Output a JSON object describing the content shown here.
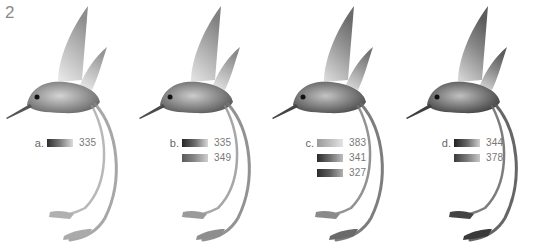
{
  "figure": {
    "number": "2"
  },
  "panels": [
    {
      "label": "a.",
      "swatches": [
        {
          "value": "335",
          "gradient": [
            "#2e2e2e",
            "#7a7a7a",
            "#dcdcdc"
          ]
        }
      ]
    },
    {
      "label": "b.",
      "swatches": [
        {
          "value": "335",
          "gradient": [
            "#262626",
            "#6c6c6c",
            "#d8d8d8"
          ]
        },
        {
          "value": "349",
          "gradient": [
            "#5a5a5a",
            "#8a8a8a",
            "#cfcfcf"
          ]
        }
      ]
    },
    {
      "label": "c.",
      "swatches": [
        {
          "value": "383",
          "gradient": [
            "#9a9a9a",
            "#bdbdbd",
            "#e3e3e3"
          ]
        },
        {
          "value": "341",
          "gradient": [
            "#2a2a2a",
            "#6e6e6e",
            "#bdbdbd"
          ]
        },
        {
          "value": "327",
          "gradient": [
            "#2c2c2c",
            "#5e5e5e",
            "#b0b0b0"
          ]
        }
      ]
    },
    {
      "label": "d.",
      "swatches": [
        {
          "value": "344",
          "gradient": [
            "#222222",
            "#666666",
            "#d0d0d0"
          ]
        },
        {
          "value": "378",
          "gradient": [
            "#3a3a3a",
            "#7a7a7a",
            "#c8c8c8"
          ]
        }
      ]
    }
  ],
  "colors": {
    "background": "#ffffff",
    "bird_dark": "#3a3a3a",
    "bird_mid": "#8c8c8c",
    "bird_light": "#d6d6d6"
  }
}
